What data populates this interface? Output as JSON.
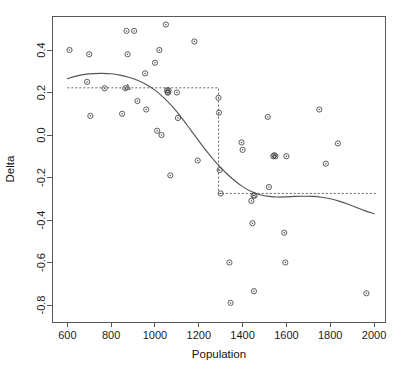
{
  "chart_data": {
    "type": "scatter",
    "title": "",
    "xlabel": "Population",
    "ylabel": "Delta",
    "xlim": [
      530,
      2050
    ],
    "ylim": [
      -0.88,
      0.56
    ],
    "grid": false,
    "legend": "none",
    "xticks": [
      600,
      800,
      1000,
      1200,
      1400,
      1600,
      1800,
      2000
    ],
    "xtick_labels": [
      "600",
      "800",
      "1000",
      "1200",
      "1400",
      "1600",
      "1800",
      "2000"
    ],
    "yticks": [
      0.4,
      0.2,
      0.0,
      -0.2,
      -0.4,
      -0.6,
      -0.8
    ],
    "ytick_labels": [
      "0.4",
      "0.2",
      "0.0",
      "-0.2",
      "-0.4",
      "-0.6",
      "-0.8"
    ],
    "series": [
      {
        "name": "observations",
        "marker": "open-circle-dot",
        "color": "#4a4a4a",
        "x": [
          610,
          690,
          700,
          705,
          770,
          850,
          865,
          870,
          875,
          905,
          920,
          955,
          960,
          1000,
          1010,
          1020,
          1030,
          1050,
          1055,
          1058,
          1060,
          1062,
          1070,
          1100,
          1105,
          1180,
          1195,
          1290,
          1292,
          1295,
          1300,
          1340,
          1345,
          1395,
          1400,
          1440,
          1445,
          1450,
          1452,
          1455,
          1515,
          1520,
          1540,
          1545,
          1550,
          1590,
          1595,
          1600,
          1750,
          1780,
          1835,
          1965
        ],
        "y": [
          0.4,
          0.25,
          0.38,
          0.09,
          0.22,
          0.1,
          0.22,
          0.49,
          0.38,
          0.49,
          0.16,
          0.29,
          0.12,
          0.34,
          0.02,
          0.4,
          0.0,
          0.52,
          0.21,
          0.2,
          0.2,
          0.21,
          -0.19,
          0.2,
          0.08,
          0.44,
          -0.12,
          0.175,
          0.105,
          -0.165,
          -0.275,
          -0.6,
          -0.79,
          -0.035,
          -0.07,
          -0.31,
          -0.415,
          -0.285,
          -0.735,
          -0.285,
          0.085,
          -0.245,
          -0.1,
          -0.095,
          -0.1,
          -0.46,
          -0.6,
          -0.1,
          0.12,
          -0.135,
          -0.04,
          -0.745
        ]
      }
    ],
    "annotations": [
      {
        "type": "triangle-marker",
        "x": 875,
        "y": 0.225
      }
    ],
    "fitted_curve": {
      "name": "smooth-fit",
      "style": "solid",
      "color": "#555555",
      "x": [
        600,
        640,
        680,
        720,
        760,
        800,
        840,
        880,
        920,
        960,
        1000,
        1040,
        1080,
        1120,
        1160,
        1200,
        1240,
        1280,
        1320,
        1360,
        1400,
        1440,
        1480,
        1520,
        1560,
        1600,
        1640,
        1680,
        1720,
        1760,
        1800,
        1840,
        1880,
        1920,
        1960,
        2000
      ],
      "y": [
        0.265,
        0.277,
        0.285,
        0.289,
        0.29,
        0.288,
        0.282,
        0.272,
        0.258,
        0.238,
        0.211,
        0.176,
        0.133,
        0.083,
        0.028,
        -0.028,
        -0.082,
        -0.131,
        -0.174,
        -0.212,
        -0.243,
        -0.266,
        -0.281,
        -0.289,
        -0.292,
        -0.291,
        -0.289,
        -0.288,
        -0.289,
        -0.293,
        -0.3,
        -0.311,
        -0.325,
        -0.341,
        -0.357,
        -0.37
      ]
    },
    "step_function": {
      "name": "step-fit",
      "style": "dashed",
      "color": "#6a6a6a",
      "breakpoint": 1290,
      "level_left": 0.222,
      "level_right": -0.275,
      "x_start": 600,
      "x_end": 2010
    }
  }
}
